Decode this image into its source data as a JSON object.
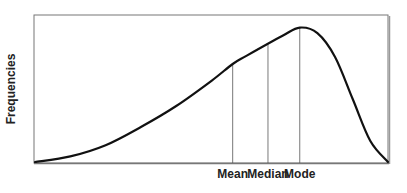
{
  "chart_data": {
    "type": "line",
    "title": "",
    "xlabel": "",
    "ylabel": "Frequencies",
    "grid": false,
    "legend": null,
    "x_range": [
      0,
      100
    ],
    "y_range": [
      0,
      100
    ],
    "curve": {
      "x": [
        0,
        10,
        20,
        30,
        40,
        50,
        56,
        60,
        70,
        75,
        80,
        85,
        90,
        95,
        100
      ],
      "y": [
        0,
        4,
        12,
        25,
        40,
        58,
        70,
        76,
        90,
        96,
        92,
        75,
        45,
        15,
        0
      ]
    },
    "markers": [
      {
        "label": "Mean",
        "x": 56,
        "y": 70
      },
      {
        "label": "Median",
        "x": 66,
        "y": 84
      },
      {
        "label": "Mode",
        "x": 75,
        "y": 96
      }
    ],
    "colors": {
      "curve": "#111111",
      "frame": "#666666",
      "marker_lines": "#555555"
    }
  }
}
